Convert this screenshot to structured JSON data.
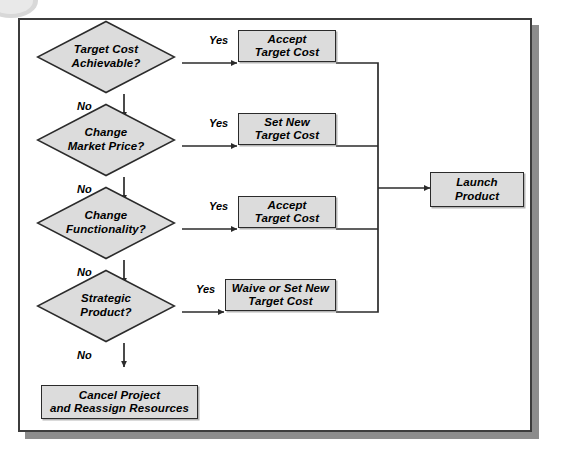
{
  "figure": {
    "background_color": "#ffffff",
    "frame_border_color": "#3c3c3c",
    "shadow_color": "#8c8c8c",
    "node_fill_color": "#dcdcdc",
    "node_border_color": "#2b2b2b",
    "line_color": "#2b2b2b"
  },
  "decisions": [
    {
      "id": "target-cost-achievable",
      "text": "Target Cost\nAchievable?",
      "yes_label": "Yes",
      "no_label": "No"
    },
    {
      "id": "change-market-price",
      "text": "Change\nMarket Price?",
      "yes_label": "Yes",
      "no_label": "No"
    },
    {
      "id": "change-functionality",
      "text": "Change\nFunctionality?",
      "yes_label": "Yes",
      "no_label": "No"
    },
    {
      "id": "strategic-product",
      "text": "Strategic\nProduct?",
      "yes_label": "Yes",
      "no_label": "No"
    }
  ],
  "processes": [
    {
      "id": "accept-target-cost-1",
      "text": "Accept\nTarget Cost"
    },
    {
      "id": "set-new-target-cost",
      "text": "Set New\nTarget Cost"
    },
    {
      "id": "accept-target-cost-2",
      "text": "Accept\nTarget Cost"
    },
    {
      "id": "waive-or-set-new-target-cost",
      "text": "Waive or Set New\nTarget Cost"
    }
  ],
  "terminals": [
    {
      "id": "launch-product",
      "text": "Launch\nProduct"
    },
    {
      "id": "cancel-project",
      "text": "Cancel Project\nand Reassign Resources"
    }
  ]
}
